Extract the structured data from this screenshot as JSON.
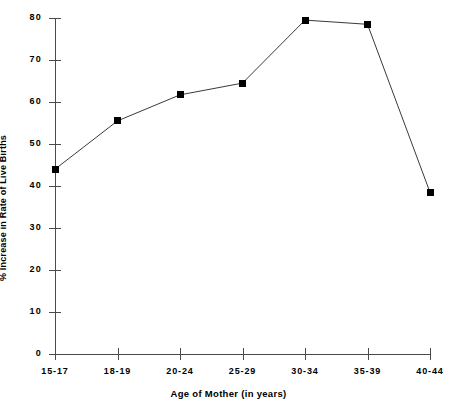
{
  "chart_data": {
    "type": "line",
    "title": "",
    "xlabel": "Age of Mother (in years)",
    "ylabel": "% Increase in Rate of Live Births",
    "categories": [
      "15-17",
      "18-19",
      "20-24",
      "25-29",
      "30-34",
      "35-39",
      "40-44"
    ],
    "values": [
      44.0,
      55.5,
      61.7,
      64.5,
      79.5,
      78.5,
      38.5
    ],
    "series": [
      {
        "name": "% Increase in Rate of Live Births",
        "values": [
          44.0,
          55.5,
          61.7,
          64.5,
          79.5,
          78.5,
          38.5
        ]
      }
    ],
    "ylim": [
      0,
      80
    ],
    "yticks": [
      0,
      10,
      20,
      30,
      40,
      50,
      60,
      70,
      80
    ],
    "ytick_labels": [
      "0",
      "10",
      "20",
      "30",
      "40",
      "50",
      "60",
      "70",
      "80"
    ],
    "xtick_labels": [
      "15-17",
      "18-19",
      "20-24",
      "25-29",
      "30-34",
      "35-39",
      "40-44"
    ],
    "grid": false,
    "legend": false,
    "legend_position": "none",
    "marker": "square",
    "marker_color": "#000000",
    "line_color": "#3a3a3a",
    "background_color": "#ffffff",
    "axis_color": "#4a4a4a"
  }
}
